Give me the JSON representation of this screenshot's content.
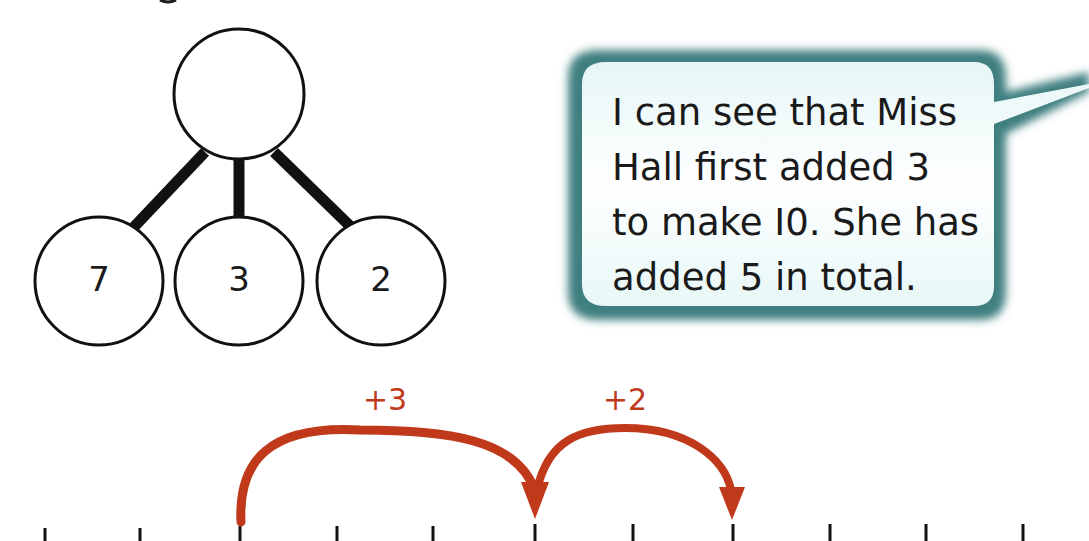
{
  "part_whole_model": {
    "whole": "",
    "parts": [
      "7",
      "3",
      "2"
    ]
  },
  "speech_bubble": {
    "lines": [
      "I can see that Miss",
      "Hall first added 3",
      "to make I0. She has",
      "added 5 in total."
    ]
  },
  "number_line": {
    "tick_count": 11,
    "jumps": [
      {
        "label": "+3",
        "from_tick": 2,
        "to_tick": 5
      },
      {
        "label": "+2",
        "from_tick": 5,
        "to_tick": 7
      }
    ]
  },
  "colors": {
    "jump_arrow": "#c0391b",
    "bubble_border": "#3f7f80",
    "bubble_fill": "#f2fbfb",
    "ink": "#1a1a1a"
  }
}
